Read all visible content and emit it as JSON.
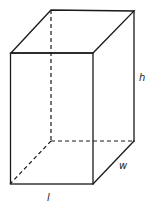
{
  "figure": {
    "type": "rectangular-prism",
    "labels": {
      "height": "h",
      "width": "w",
      "length": "l"
    },
    "colors": {
      "stroke": "#1a1a1a",
      "background": "#ffffff"
    }
  }
}
